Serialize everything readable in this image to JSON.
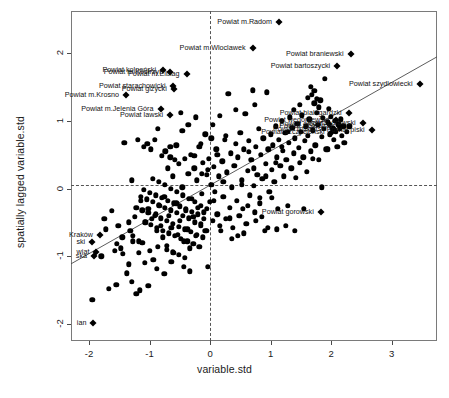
{
  "chart_data": {
    "type": "scatter",
    "title": "",
    "subtitle": "",
    "xlabel": "variable.std",
    "ylabel": "spatially lagged variable.std",
    "xlim": [
      -2.3,
      3.75
    ],
    "ylim": [
      -2.25,
      2.62
    ],
    "xticks": [
      "-2",
      "-1",
      "0",
      "1",
      "2",
      "3"
    ],
    "xtickvals": [
      -2,
      -1,
      0,
      1,
      2,
      3
    ],
    "yticks": [
      "-2",
      "-1",
      "0",
      "1",
      "2"
    ],
    "ytickvals": [
      -2,
      -1,
      0,
      1,
      2
    ],
    "grid": false,
    "legend": "none",
    "reference_lines": {
      "vertical_x": 0,
      "horizontal_y": 0.05,
      "style": "dashed"
    },
    "regression_line": {
      "slope": 0.505,
      "intercept": 0.05,
      "style": "solid",
      "color": "#4a4a4a"
    },
    "point_style": {
      "regular": "filled-circle",
      "influential": "filled-diamond",
      "color": "#000000"
    },
    "labeled_points": [
      {
        "label": "Powiat m.Radom",
        "x": 1.14,
        "y": 2.46,
        "side": "left"
      },
      {
        "label": "Powiat m.Wloclawek",
        "x": 0.7,
        "y": 2.08,
        "side": "left"
      },
      {
        "label": "Powiat braniewski",
        "x": 2.32,
        "y": 1.98,
        "side": "left"
      },
      {
        "label": "Powiat bartoszycki",
        "x": 2.1,
        "y": 1.81,
        "side": "left"
      },
      {
        "label": "Powiat kolneński",
        "x": -0.78,
        "y": 1.75,
        "side": "left"
      },
      {
        "label": "Powiat m.Kostrzyn",
        "x": -0.66,
        "y": 1.72,
        "side": "left"
      },
      {
        "label": "Powiat m.Elblag",
        "x": -0.39,
        "y": 1.69,
        "side": "left"
      },
      {
        "label": "Powiat szydlowiecki",
        "x": 3.46,
        "y": 1.54,
        "side": "left"
      },
      {
        "label": "Powiat starachowicki",
        "x": -0.62,
        "y": 1.52,
        "side": "left"
      },
      {
        "label": "Powiat gizycki",
        "x": -0.6,
        "y": 1.47,
        "side": "left"
      },
      {
        "label": "Powiat m.Krosno",
        "x": -1.39,
        "y": 1.38,
        "side": "left"
      },
      {
        "label": "Powiat m.Jelenia Góra",
        "x": -0.82,
        "y": 1.17,
        "side": "left"
      },
      {
        "label": "Powiat bialogardzki",
        "x": 2.29,
        "y": 1.12,
        "side": "left"
      },
      {
        "label": "Powiat lawski",
        "x": -0.66,
        "y": 1.09,
        "side": "left"
      },
      {
        "label": "Powiat wegorzewski",
        "x": 2.08,
        "y": 1.01,
        "side": "left"
      },
      {
        "label": "Powiat olecki",
        "x": 1.96,
        "y": 0.96,
        "side": "left"
      },
      {
        "label": "Powiat zlotowski",
        "x": 2.13,
        "y": 0.93,
        "side": "left"
      },
      {
        "label": "Powiat drawski",
        "x": 2.52,
        "y": 0.97,
        "side": "left"
      },
      {
        "label": "Powiat lidzbarski",
        "x": 2.04,
        "y": 0.88,
        "side": "left"
      },
      {
        "label": "Powiat szczycienski",
        "x": 2.01,
        "y": 0.84,
        "side": "left"
      },
      {
        "label": "Powiat piski",
        "x": 2.67,
        "y": 0.86,
        "side": "left"
      },
      {
        "label": "Powiat gorowski",
        "x": 1.83,
        "y": -0.34,
        "side": "left"
      },
      {
        "label": "Kraków",
        "x": -1.82,
        "y": -0.68,
        "side": "left"
      },
      {
        "label": "ski",
        "x": -1.95,
        "y": -0.79,
        "side": "left"
      },
      {
        "label": "wiat",
        "x": -1.88,
        "y": -0.94,
        "side": "left"
      },
      {
        "label": "ska",
        "x": -1.92,
        "y": -1.0,
        "side": "left"
      },
      {
        "label": "ian",
        "x": -1.93,
        "y": -1.98,
        "side": "left"
      }
    ],
    "points": [
      [
        -1.95,
        -1.64
      ],
      [
        -1.8,
        -1.0
      ],
      [
        -1.75,
        -0.45
      ],
      [
        -1.72,
        -0.6
      ],
      [
        -1.68,
        -1.48
      ],
      [
        -1.62,
        -0.33
      ],
      [
        -1.58,
        -0.92
      ],
      [
        -1.55,
        -1.42
      ],
      [
        -1.52,
        -0.55
      ],
      [
        -1.48,
        -0.88
      ],
      [
        -1.45,
        -0.72
      ],
      [
        -1.42,
        0.68
      ],
      [
        -1.38,
        -1.25
      ],
      [
        -1.35,
        -0.5
      ],
      [
        -1.32,
        -0.62
      ],
      [
        -1.3,
        0.12
      ],
      [
        -1.28,
        -0.78
      ],
      [
        -1.25,
        -0.42
      ],
      [
        -1.22,
        -1.55
      ],
      [
        -1.2,
        0.72
      ],
      [
        -1.18,
        -0.95
      ],
      [
        -1.15,
        -0.18
      ],
      [
        -1.12,
        -0.8
      ],
      [
        -1.1,
        0.62
      ],
      [
        -1.08,
        -1.1
      ],
      [
        -1.06,
        -0.5
      ],
      [
        -1.04,
        0.66
      ],
      [
        -1.02,
        -0.3
      ],
      [
        -1.0,
        -0.92
      ],
      [
        -0.98,
        0.58
      ],
      [
        -0.96,
        -0.45
      ],
      [
        -0.94,
        -1.05
      ],
      [
        -0.92,
        0.72
      ],
      [
        -0.9,
        -0.38
      ],
      [
        -0.88,
        -0.62
      ],
      [
        -0.86,
        0.88
      ],
      [
        -0.84,
        -0.25
      ],
      [
        -0.82,
        -0.55
      ],
      [
        -0.8,
        0.48
      ],
      [
        -0.78,
        -0.72
      ],
      [
        -0.76,
        -0.12
      ],
      [
        -0.74,
        0.55
      ],
      [
        -0.72,
        -0.85
      ],
      [
        -0.7,
        0.3
      ],
      [
        -0.68,
        -0.4
      ],
      [
        -0.66,
        0.62
      ],
      [
        -0.64,
        -0.58
      ],
      [
        -0.62,
        0.18
      ],
      [
        -0.6,
        -0.95
      ],
      [
        -0.58,
        0.42
      ],
      [
        -0.56,
        -0.22
      ],
      [
        -0.54,
        -0.68
      ],
      [
        -0.52,
        0.36
      ],
      [
        -0.5,
        -0.48
      ],
      [
        -0.48,
        1.12
      ],
      [
        -0.46,
        0.02
      ],
      [
        -0.44,
        -0.78
      ],
      [
        -0.42,
        0.44
      ],
      [
        -0.4,
        -0.32
      ],
      [
        -0.38,
        -0.6
      ],
      [
        -0.36,
        0.22
      ],
      [
        -0.34,
        -0.88
      ],
      [
        -0.32,
        0.5
      ],
      [
        -0.3,
        -0.15
      ],
      [
        -0.28,
        -0.42
      ],
      [
        -0.26,
        0.3
      ],
      [
        -0.24,
        -0.7
      ],
      [
        -0.22,
        0.12
      ],
      [
        -0.2,
        -0.28
      ],
      [
        -0.18,
        0.62
      ],
      [
        -0.16,
        -0.52
      ],
      [
        -0.14,
        -0.08
      ],
      [
        -0.12,
        0.38
      ],
      [
        -0.1,
        -0.35
      ],
      [
        -0.08,
        -0.62
      ],
      [
        -0.06,
        0.2
      ],
      [
        -0.04,
        -1.15
      ],
      [
        -0.02,
        0.44
      ],
      [
        0.0,
        -0.2
      ],
      [
        0.02,
        0.06
      ],
      [
        0.04,
        -0.48
      ],
      [
        0.06,
        0.32
      ],
      [
        0.08,
        -0.05
      ],
      [
        0.1,
        0.58
      ],
      [
        0.12,
        -0.38
      ],
      [
        0.14,
        0.18
      ],
      [
        0.16,
        1.07
      ],
      [
        0.18,
        -0.62
      ],
      [
        0.2,
        0.4
      ],
      [
        0.22,
        -0.12
      ],
      [
        0.24,
        0.72
      ],
      [
        0.26,
        -0.45
      ],
      [
        0.28,
        0.24
      ],
      [
        0.3,
        1.4
      ],
      [
        0.32,
        -0.28
      ],
      [
        0.34,
        0.52
      ],
      [
        0.36,
        0.02
      ],
      [
        0.38,
        -0.58
      ],
      [
        0.4,
        0.34
      ],
      [
        0.42,
        0.66
      ],
      [
        0.44,
        -0.18
      ],
      [
        0.46,
        0.46
      ],
      [
        0.48,
        -0.4
      ],
      [
        0.5,
        0.82
      ],
      [
        0.52,
        0.12
      ],
      [
        0.54,
        -0.3
      ],
      [
        0.56,
        0.58
      ],
      [
        0.58,
        1.1
      ],
      [
        0.6,
        -0.52
      ],
      [
        0.62,
        0.26
      ],
      [
        0.64,
        0.7
      ],
      [
        0.66,
        -0.1
      ],
      [
        0.68,
        0.42
      ],
      [
        0.7,
        1.45
      ],
      [
        0.72,
        0.04
      ],
      [
        0.74,
        -0.35
      ],
      [
        0.76,
        0.62
      ],
      [
        0.78,
        0.2
      ],
      [
        0.8,
        0.88
      ],
      [
        0.82,
        -0.22
      ],
      [
        0.84,
        0.5
      ],
      [
        0.86,
        0.14
      ],
      [
        0.88,
        0.74
      ],
      [
        0.9,
        -0.62
      ],
      [
        0.92,
        0.36
      ],
      [
        0.94,
        1.42
      ],
      [
        0.96,
        0.58
      ],
      [
        0.98,
        -0.05
      ],
      [
        1.0,
        0.8
      ],
      [
        1.02,
        0.28
      ],
      [
        1.04,
        0.64
      ],
      [
        1.06,
        0.1
      ],
      [
        1.08,
        0.92
      ],
      [
        1.1,
        0.46
      ],
      [
        1.12,
        -0.3
      ],
      [
        1.14,
        0.72
      ],
      [
        1.16,
        0.34
      ],
      [
        1.18,
        1.0
      ],
      [
        1.2,
        0.56
      ],
      [
        1.22,
        0.18
      ],
      [
        1.24,
        0.82
      ],
      [
        1.26,
        0.42
      ],
      [
        1.28,
        -0.25
      ],
      [
        1.3,
        0.68
      ],
      [
        1.32,
        1.05
      ],
      [
        1.34,
        0.3
      ],
      [
        1.36,
        0.9
      ],
      [
        1.38,
        0.52
      ],
      [
        1.4,
        0.74
      ],
      [
        1.42,
        0.16
      ],
      [
        1.44,
        0.96
      ],
      [
        1.46,
        0.6
      ],
      [
        1.48,
        0.38
      ],
      [
        1.5,
        0.84
      ],
      [
        1.52,
        1.08
      ],
      [
        1.54,
        0.46
      ],
      [
        1.56,
        0.7
      ],
      [
        1.58,
        0.92
      ],
      [
        1.6,
        0.25
      ],
      [
        1.62,
        0.78
      ],
      [
        1.64,
        1.02
      ],
      [
        1.66,
        0.55
      ],
      [
        1.68,
        1.38
      ],
      [
        1.7,
        0.86
      ],
      [
        1.72,
        1.44
      ],
      [
        1.74,
        0.64
      ],
      [
        1.76,
        1.12
      ],
      [
        1.78,
        0.94
      ],
      [
        1.8,
        0.42
      ],
      [
        1.82,
        1.3
      ],
      [
        1.84,
        0.76
      ],
      [
        1.86,
        1.04
      ],
      [
        1.88,
        0.88
      ],
      [
        1.9,
        1.62
      ],
      [
        1.92,
        0.58
      ],
      [
        1.94,
        0.98
      ],
      [
        1.96,
        1.18
      ],
      [
        1.98,
        0.8
      ],
      [
        2.0,
        1.06
      ],
      [
        2.02,
        0.9
      ],
      [
        2.04,
        0.72
      ],
      [
        2.06,
        1.0
      ],
      [
        2.08,
        0.84
      ],
      [
        2.1,
        0.62
      ],
      [
        2.12,
        0.96
      ],
      [
        2.14,
        0.88
      ],
      [
        2.16,
        1.02
      ],
      [
        2.18,
        0.78
      ],
      [
        2.2,
        0.92
      ],
      [
        2.22,
        0.68
      ],
      [
        1.85,
        0.02
      ],
      [
        1.95,
        0.58
      ],
      [
        1.7,
        0.44
      ],
      [
        1.55,
        -0.3
      ],
      [
        1.4,
        -0.62
      ],
      [
        1.25,
        -0.55
      ],
      [
        1.1,
        -0.6
      ],
      [
        0.95,
        -0.58
      ],
      [
        0.85,
        -0.42
      ],
      [
        0.75,
        -0.48
      ],
      [
        -0.05,
        -0.62
      ],
      [
        -0.15,
        -0.55
      ],
      [
        -0.25,
        -0.5
      ],
      [
        -0.35,
        -0.44
      ],
      [
        -0.45,
        -0.4
      ],
      [
        -0.55,
        -0.36
      ],
      [
        -0.65,
        -0.32
      ],
      [
        -0.75,
        -0.28
      ],
      [
        -0.85,
        -0.24
      ],
      [
        -0.95,
        -0.2
      ],
      [
        -1.05,
        -0.16
      ],
      [
        -1.15,
        -0.12
      ],
      [
        -0.1,
        -0.45
      ],
      [
        -0.2,
        -0.38
      ],
      [
        -0.3,
        -0.34
      ],
      [
        -0.4,
        -0.3
      ],
      [
        -0.5,
        -0.26
      ],
      [
        -0.6,
        -0.22
      ],
      [
        -0.7,
        -0.18
      ],
      [
        -0.8,
        -0.14
      ],
      [
        -0.9,
        -0.1
      ],
      [
        -1.0,
        -0.06
      ],
      [
        -1.1,
        -0.02
      ],
      [
        -0.05,
        -0.3
      ],
      [
        -0.15,
        -0.25
      ],
      [
        -0.25,
        -0.2
      ],
      [
        -0.35,
        -0.15
      ],
      [
        -0.45,
        -0.1
      ],
      [
        -0.55,
        -0.05
      ],
      [
        -0.65,
        0.0
      ],
      [
        -0.75,
        0.05
      ],
      [
        -0.85,
        0.1
      ],
      [
        -0.95,
        0.14
      ],
      [
        -0.12,
        -0.72
      ],
      [
        -0.22,
        -0.68
      ],
      [
        -0.32,
        -0.64
      ],
      [
        -0.42,
        -0.6
      ],
      [
        -0.52,
        -0.56
      ],
      [
        -0.62,
        -0.52
      ],
      [
        -0.72,
        -0.48
      ],
      [
        -0.82,
        -0.44
      ],
      [
        -0.92,
        -0.4
      ],
      [
        -1.02,
        -0.36
      ],
      [
        -1.12,
        -0.32
      ],
      [
        -1.22,
        -0.28
      ],
      [
        -0.18,
        -0.86
      ],
      [
        -0.28,
        -0.82
      ],
      [
        -0.38,
        -0.78
      ],
      [
        -0.48,
        -0.74
      ],
      [
        -0.58,
        -0.7
      ],
      [
        -0.68,
        -0.66
      ],
      [
        -0.78,
        -0.62
      ],
      [
        -0.88,
        -0.58
      ],
      [
        -0.98,
        -0.54
      ],
      [
        -1.08,
        -0.5
      ],
      [
        -0.42,
        -1.02
      ],
      [
        -0.52,
        -0.98
      ],
      [
        -0.62,
        -0.94
      ],
      [
        -0.72,
        -0.9
      ],
      [
        -0.86,
        -0.86
      ],
      [
        -1.18,
        -0.78
      ],
      [
        -1.28,
        -0.7
      ],
      [
        -1.34,
        -1.12
      ],
      [
        -1.44,
        -0.96
      ],
      [
        -1.54,
        -0.82
      ],
      [
        -0.08,
        0.8
      ],
      [
        0.02,
        0.74
      ],
      [
        0.12,
        0.5
      ],
      [
        0.22,
        0.1
      ],
      [
        0.32,
        -0.44
      ],
      [
        -0.24,
        1.05
      ],
      [
        -0.36,
        0.94
      ],
      [
        -0.46,
        0.85
      ],
      [
        -0.56,
        0.64
      ],
      [
        -0.66,
        0.46
      ],
      [
        0.42,
        1.16
      ],
      [
        0.52,
        0.06
      ],
      [
        0.62,
        -0.25
      ],
      [
        0.72,
        0.3
      ],
      [
        0.82,
        -0.14
      ],
      [
        -0.04,
        0.28
      ],
      [
        -0.14,
        0.22
      ],
      [
        0.06,
        -0.18
      ],
      [
        0.16,
        -0.55
      ],
      [
        0.26,
        0.78
      ],
      [
        -1.3,
        -1.38
      ],
      [
        -1.16,
        -1.5
      ],
      [
        -1.02,
        -1.44
      ],
      [
        -0.88,
        -1.18
      ],
      [
        -0.76,
        -1.26
      ],
      [
        -0.64,
        -1.08
      ],
      [
        -0.44,
        -1.16
      ],
      [
        -0.34,
        -1.22
      ],
      [
        0.92,
        0.18
      ],
      [
        1.02,
        -0.14
      ],
      [
        2.26,
        0.84
      ],
      [
        2.3,
        0.92
      ],
      [
        1.72,
        1.26
      ],
      [
        1.76,
        1.32
      ],
      [
        1.8,
        1.2
      ],
      [
        1.66,
        1.5
      ],
      [
        1.62,
        1.34
      ],
      [
        0.56,
        -0.66
      ],
      [
        0.46,
        -0.7
      ],
      [
        0.36,
        -0.74
      ],
      [
        -0.16,
        0.66
      ],
      [
        0.04,
        0.94
      ],
      [
        -0.26,
        0.48
      ],
      [
        0.64,
        0.54
      ],
      [
        0.74,
        1.24
      ],
      [
        1.08,
        0.38
      ],
      [
        1.18,
        0.62
      ],
      [
        1.28,
        0.84
      ],
      [
        1.38,
        1.16
      ],
      [
        1.48,
        1.24
      ]
    ]
  }
}
